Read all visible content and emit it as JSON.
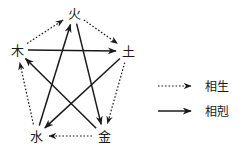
{
  "diagram": {
    "title": "",
    "nodes": [
      {
        "id": "fire",
        "label": "火",
        "x": 74,
        "y": 13
      },
      {
        "id": "earth",
        "label": "土",
        "x": 128,
        "y": 51
      },
      {
        "id": "metal",
        "label": "金",
        "x": 104,
        "y": 136
      },
      {
        "id": "water",
        "label": "水",
        "x": 36,
        "y": 136
      },
      {
        "id": "wood",
        "label": "木",
        "x": 17,
        "y": 50
      }
    ],
    "generating_cycle": {
      "name": "相生",
      "style": "dotted",
      "color": "#1a1a1a",
      "edges": [
        {
          "from": "wood",
          "to": "fire"
        },
        {
          "from": "fire",
          "to": "earth"
        },
        {
          "from": "earth",
          "to": "metal"
        },
        {
          "from": "metal",
          "to": "water"
        },
        {
          "from": "water",
          "to": "wood"
        }
      ]
    },
    "overcoming_cycle": {
      "name": "相剋",
      "style": "solid",
      "color": "#1a1a1a",
      "edges": [
        {
          "from": "wood",
          "to": "earth"
        },
        {
          "from": "earth",
          "to": "water"
        },
        {
          "from": "water",
          "to": "fire"
        },
        {
          "from": "fire",
          "to": "metal"
        },
        {
          "from": "metal",
          "to": "wood"
        }
      ]
    }
  },
  "legend": {
    "items": [
      {
        "id": "sheng",
        "label": "相生",
        "style": "dotted"
      },
      {
        "id": "ke",
        "label": "相剋",
        "style": "solid"
      }
    ]
  }
}
